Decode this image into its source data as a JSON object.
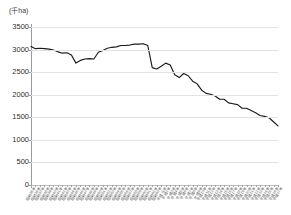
{
  "chart_data": {
    "type": "line",
    "title": "",
    "subtitle": "",
    "unit_label": "(千ha)",
    "xlabel": "",
    "ylabel": "",
    "ylim": [
      0,
      3500
    ],
    "ytick_step": 500,
    "yticks": [
      "0",
      "500",
      "1000",
      "1500",
      "2000",
      "2500",
      "3000",
      "3500"
    ],
    "grid": true,
    "legend": "none",
    "categories": [
      "昭和35年",
      "昭和36年",
      "昭和37年",
      "昭和38年",
      "昭和39年",
      "昭和40年",
      "昭和41年",
      "昭和42年",
      "昭和43年",
      "昭和44年",
      "昭和45年",
      "昭和46年",
      "昭和47年",
      "昭和48年",
      "昭和49年",
      "昭和50年",
      "昭和51年",
      "昭和52年",
      "昭和53年",
      "昭和54年",
      "昭和55年",
      "昭和56年",
      "昭和57年",
      "昭和58年",
      "昭和59年",
      "昭和60年",
      "昭和61年",
      "昭和62年",
      "昭和63年",
      "平成元年",
      "平成2年",
      "平成3年",
      "平成4年",
      "平成5年",
      "平成6年",
      "平成7年",
      "平成8年",
      "平成9年",
      "平成10年",
      "平成11年",
      "平成12年",
      "平成13年",
      "平成14年",
      "平成15年",
      "平成16年",
      "平成17年",
      "平成18年",
      "平成19年",
      "平成20年",
      "平成21年",
      "平成22年",
      "平成23年",
      "平成24年",
      "平成25年",
      "平成26年",
      "平成27年"
    ],
    "series": [
      {
        "name": "作付面積",
        "color": "#1a1a1a",
        "values": [
          3070,
          3020,
          3030,
          3020,
          3010,
          2990,
          2950,
          2920,
          2930,
          2880,
          2700,
          2760,
          2790,
          2800,
          2790,
          2940,
          2980,
          3030,
          3050,
          3060,
          3090,
          3090,
          3100,
          3120,
          3120,
          3130,
          3090,
          2600,
          2570,
          2630,
          2700,
          2660,
          2440,
          2380,
          2470,
          2420,
          2300,
          2240,
          2100,
          2030,
          2010,
          1970,
          1900,
          1900,
          1820,
          1800,
          1780,
          1700,
          1700,
          1650,
          1600,
          1540,
          1520,
          1490,
          1400,
          1310
        ]
      }
    ]
  },
  "axis": {
    "y_axis_name": "y-axis",
    "x_axis_name": "x-axis"
  }
}
